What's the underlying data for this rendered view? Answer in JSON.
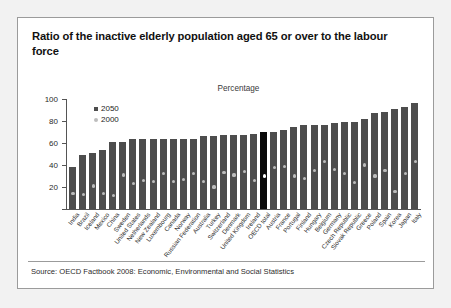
{
  "card": {
    "title": "Ratio of the inactive elderly population aged 65 or over to the labour force",
    "source": "Source: OECD Factbook 2008: Economic, Environmental and Social Statistics"
  },
  "legend": {
    "items": [
      {
        "label": "2050",
        "color": "#4d4d4d",
        "marker": "square"
      },
      {
        "label": "2000",
        "color": "#bdbdbd",
        "marker": "circle"
      }
    ]
  },
  "colors": {
    "bar_2050": "#4d4d4d",
    "bar_highlight": "#0a0a0a",
    "marker_2000": "#bdbdbd",
    "marker_on_dark": "#ffffff",
    "axis": "#555555",
    "card_border": "#9b9b9b",
    "page_background": "#f2f2f2"
  },
  "chart_data": {
    "type": "bar",
    "title": "Ratio of the inactive elderly population aged 65 or over to the labour force",
    "subtitle": "Percentage",
    "xlabel": "",
    "ylabel": "",
    "ylim": [
      0,
      100
    ],
    "yticks": [
      0,
      20,
      40,
      60,
      80,
      100
    ],
    "ytick_labels": [
      "",
      "20",
      "40",
      "60",
      "80",
      "100"
    ],
    "grid": false,
    "legend_position": "top-left-inside",
    "highlight_category": "OECD total",
    "categories": [
      "India",
      "Brazil",
      "Iceland",
      "Mexico",
      "China",
      "Sweden",
      "United States",
      "Netherlands",
      "New Zealand",
      "Luxembourg",
      "Canada",
      "Norway",
      "Russian Federation",
      "Australia",
      "Turkey",
      "Switzerland",
      "Denmark",
      "United Kingdom",
      "Ireland",
      "OECD total",
      "Austria",
      "France",
      "Portugal",
      "Finland",
      "Hungary",
      "Belgium",
      "Germany",
      "Czech Republic",
      "Slovak Republic",
      "Greece",
      "Poland",
      "Spain",
      "Korea",
      "Japan",
      "Italy"
    ],
    "series": [
      {
        "name": "2050",
        "type": "bar",
        "color": "#4d4d4d",
        "values": [
          38,
          49,
          51,
          54,
          61,
          61,
          64,
          64,
          64,
          64,
          64,
          64,
          64,
          66,
          66,
          67,
          67,
          67,
          68,
          70,
          70,
          72,
          75,
          76,
          76,
          76,
          78,
          79,
          79,
          82,
          87,
          88,
          91,
          93,
          96
        ]
      },
      {
        "name": "2000",
        "type": "scatter",
        "color": "#bdbdbd",
        "values": [
          14,
          13,
          21,
          14,
          12,
          31,
          23,
          26,
          25,
          32,
          25,
          27,
          32,
          25,
          20,
          33,
          31,
          34,
          26,
          30,
          38,
          39,
          30,
          28,
          35,
          43,
          36,
          32,
          24,
          40,
          30,
          35,
          16,
          32,
          43
        ]
      }
    ]
  }
}
